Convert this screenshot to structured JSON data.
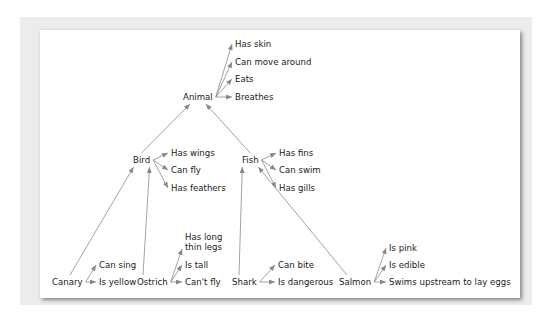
{
  "diagram": {
    "type": "semantic-network",
    "nodes": [
      {
        "id": "animal",
        "label": "Animal",
        "x": 183,
        "y": 97
      },
      {
        "id": "bird",
        "label": "Bird",
        "x": 133,
        "y": 160
      },
      {
        "id": "fish",
        "label": "Fish",
        "x": 242,
        "y": 160
      },
      {
        "id": "canary",
        "label": "Canary",
        "x": 52,
        "y": 282
      },
      {
        "id": "ostrich",
        "label": "Ostrich",
        "x": 137,
        "y": 282
      },
      {
        "id": "shark",
        "label": "Shark",
        "x": 232,
        "y": 282
      },
      {
        "id": "salmon",
        "label": "Salmon",
        "x": 339,
        "y": 282
      }
    ],
    "properties": [
      {
        "node": "animal",
        "items": [
          {
            "label": "Has skin",
            "x": 235,
            "y": 44
          },
          {
            "label": "Can move around",
            "x": 235,
            "y": 62
          },
          {
            "label": "Eats",
            "x": 235,
            "y": 79
          },
          {
            "label": "Breathes",
            "x": 235,
            "y": 97
          }
        ]
      },
      {
        "node": "bird",
        "items": [
          {
            "label": "Has wings",
            "x": 171,
            "y": 153
          },
          {
            "label": "Can fly",
            "x": 171,
            "y": 170
          },
          {
            "label": "Has feathers",
            "x": 171,
            "y": 188
          }
        ]
      },
      {
        "node": "fish",
        "items": [
          {
            "label": "Has fins",
            "x": 279,
            "y": 153
          },
          {
            "label": "Can swim",
            "x": 279,
            "y": 170
          },
          {
            "label": "Has gills",
            "x": 279,
            "y": 188
          }
        ]
      },
      {
        "node": "canary",
        "items": [
          {
            "label": "Can sing",
            "x": 99,
            "y": 265
          },
          {
            "label": "Is yellow",
            "x": 99,
            "y": 282
          }
        ]
      },
      {
        "node": "ostrich",
        "items": [
          {
            "label": "Has long\nthin legs",
            "x": 185,
            "y": 237
          },
          {
            "label": "Is tall",
            "x": 185,
            "y": 265
          },
          {
            "label": "Can't fly",
            "x": 185,
            "y": 282
          }
        ]
      },
      {
        "node": "shark",
        "items": [
          {
            "label": "Can bite",
            "x": 278,
            "y": 265
          },
          {
            "label": "Is dangerous",
            "x": 278,
            "y": 282
          }
        ]
      },
      {
        "node": "salmon",
        "items": [
          {
            "label": "Is pink",
            "x": 389,
            "y": 248
          },
          {
            "label": "Is edible",
            "x": 389,
            "y": 265
          },
          {
            "label": "Swims upstream to lay eggs",
            "x": 389,
            "y": 282
          }
        ]
      }
    ],
    "isa_edges": [
      [
        "bird",
        "animal"
      ],
      [
        "fish",
        "animal"
      ],
      [
        "canary",
        "bird"
      ],
      [
        "ostrich",
        "bird"
      ],
      [
        "shark",
        "fish"
      ],
      [
        "salmon",
        "fish"
      ]
    ]
  }
}
